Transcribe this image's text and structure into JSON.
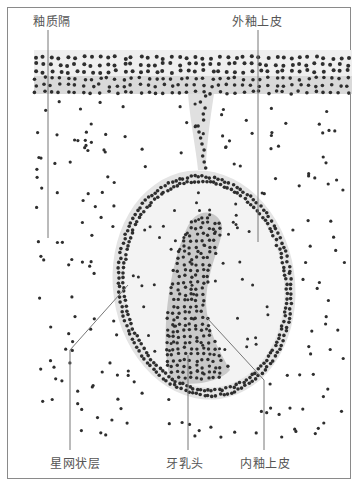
{
  "figure": {
    "labels": {
      "stellate_interstitial": "釉质隔",
      "outer_enamel_epithelium": "外釉上皮",
      "stellate_reticulum": "星网状层",
      "dental_papilla": "牙乳头",
      "inner_enamel_epithelium": "内釉上皮"
    }
  },
  "colors": {
    "border": "#8a8a8a",
    "label_text": "#555555",
    "leader_line": "#777777",
    "epithelium_fill": "#e6e6e6",
    "nucleus": "#2e2e2e",
    "papilla_fill": "#cfcfcf"
  }
}
